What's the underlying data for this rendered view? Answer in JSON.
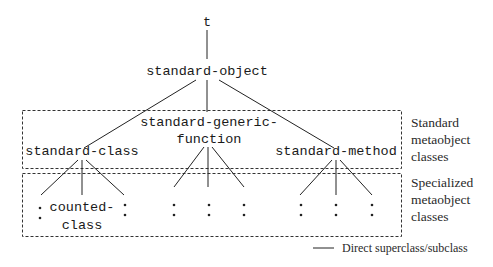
{
  "diagram": {
    "nodes": {
      "root": "t",
      "standard_object": "standard-object",
      "standard_class": "standard-class",
      "standard_generic_function_line1": "standard-generic-",
      "standard_generic_function_line2": "function",
      "standard_method": "standard-method",
      "counted_class_line1": "counted-",
      "counted_class_line2": "class"
    },
    "groups": {
      "standard": [
        "Standard",
        "metaobject",
        "classes"
      ],
      "specialized": [
        "Specialized",
        "metaobject",
        "classes"
      ]
    },
    "legend": {
      "label": "Direct superclass/subclass"
    }
  }
}
